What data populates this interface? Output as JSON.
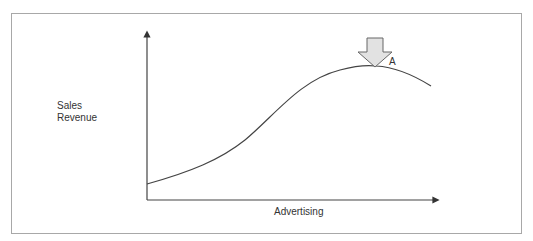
{
  "diagram": {
    "y_axis_label_line1": "Sales",
    "y_axis_label_line2": "Revenue",
    "x_axis_label": "Advertising",
    "point_label": "A",
    "curve_description": "S-shaped curve rising then peaking at point A and declining",
    "marker": "down-arrow pointing at curve peak",
    "colors": {
      "frame": "#a8a8a8",
      "axis": "#333333",
      "curve": "#444444",
      "arrow_fill": "#e0e0e0",
      "arrow_stroke": "#666666"
    }
  }
}
